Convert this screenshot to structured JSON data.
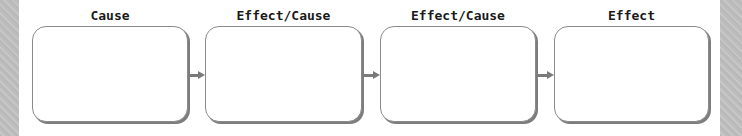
{
  "diagram": {
    "type": "cause-effect-chain",
    "colors": {
      "box_border": "#8a8a8a",
      "box_shadow": "#7d7d7d",
      "arrow": "#7a7a7a",
      "label_text": "#1a1a1a",
      "side_strip": "#bfbfbf"
    },
    "nodes": [
      {
        "label": "Cause",
        "content": ""
      },
      {
        "label": "Effect/Cause",
        "content": ""
      },
      {
        "label": "Effect/Cause",
        "content": ""
      },
      {
        "label": "Effect",
        "content": ""
      }
    ],
    "edges": [
      {
        "from": 0,
        "to": 1
      },
      {
        "from": 1,
        "to": 2
      },
      {
        "from": 2,
        "to": 3
      }
    ]
  }
}
